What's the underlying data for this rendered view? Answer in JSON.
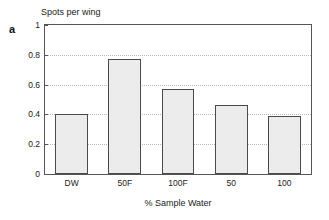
{
  "figure": {
    "panel_label": "a"
  },
  "chart_data": {
    "type": "bar",
    "title": "",
    "xlabel": "% Sample Water",
    "ylabel": "Spots per wing",
    "categories": [
      "DW",
      "50F",
      "100F",
      "50",
      "100"
    ],
    "values": [
      0.4,
      0.77,
      0.57,
      0.46,
      0.39
    ],
    "ylim": [
      0,
      1
    ],
    "yticks": [
      0,
      0.2,
      0.4,
      0.6,
      0.8,
      1
    ],
    "ytick_labels": [
      "0",
      "0.2",
      "0.4",
      "0.6",
      "0.8",
      "1"
    ],
    "grid": "horizontal-dotted",
    "legend": "none",
    "bar_fill_color": "#ececec",
    "bar_edge_color": "#4a4a4a",
    "grid_color": "#b9b9b9",
    "axis_color": "#555555"
  }
}
